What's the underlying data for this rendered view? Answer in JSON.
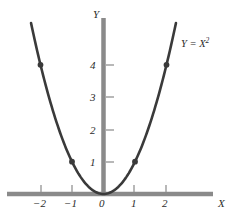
{
  "chart_data": {
    "type": "line",
    "title": "",
    "subtitle": "",
    "xlabel": "X",
    "ylabel": "Y",
    "xlim": [
      -2.3,
      2.3
    ],
    "ylim": [
      -0.2,
      5.5
    ],
    "grid": false,
    "legend_position": "none",
    "x_ticks": [
      {
        "value": -2,
        "label": "−2"
      },
      {
        "value": -1,
        "label": "−1"
      },
      {
        "value": 0,
        "label": "0"
      },
      {
        "value": 1,
        "label": "1"
      },
      {
        "value": 2,
        "label": "2"
      }
    ],
    "y_ticks": [
      {
        "value": 1,
        "label": "1"
      },
      {
        "value": 2,
        "label": "2"
      },
      {
        "value": 3,
        "label": "3"
      },
      {
        "value": 4,
        "label": "4"
      }
    ],
    "series": [
      {
        "name": "Y = X^2",
        "equation": "Y = X²",
        "curve_x_range": [
          -2.3,
          2.3
        ],
        "markers": [
          {
            "x": -2,
            "y": 4
          },
          {
            "x": -1,
            "y": 1
          },
          {
            "x": 0,
            "y": 0
          },
          {
            "x": 1,
            "y": 1
          },
          {
            "x": 2,
            "y": 4
          }
        ]
      }
    ],
    "annotations": [
      {
        "text": "Y = X²",
        "x": 2.4,
        "y": 5.05
      }
    ]
  },
  "labels": {
    "x_axis_name": "X",
    "y_axis_name": "Y",
    "curve_label_base": "Y = X",
    "curve_label_exponent": "2",
    "x_tick_0": "−2",
    "x_tick_1": "−1",
    "x_tick_2": "0",
    "x_tick_3": "1",
    "x_tick_4": "2",
    "y_tick_0": "1",
    "y_tick_1": "2",
    "y_tick_2": "3",
    "y_tick_3": "4"
  },
  "colors": {
    "axis": "#8a8a8a",
    "curve": "#3a3a3a",
    "text": "#2b2b2b",
    "background": "#ffffff",
    "marker": "#3a3a3a"
  }
}
